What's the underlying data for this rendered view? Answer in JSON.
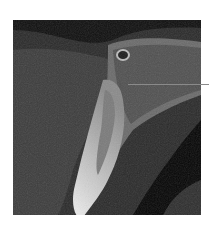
{
  "figure": {
    "type": "CBCT cross-section",
    "pointer_line": {
      "color": "#8a8a8a"
    },
    "colors": {
      "background": "#ffffff",
      "soft_tissue": "#3a3a3a",
      "air": "#0a0a0a",
      "bone": "#8c8c8c",
      "enamel": "#e6e6e6"
    }
  }
}
